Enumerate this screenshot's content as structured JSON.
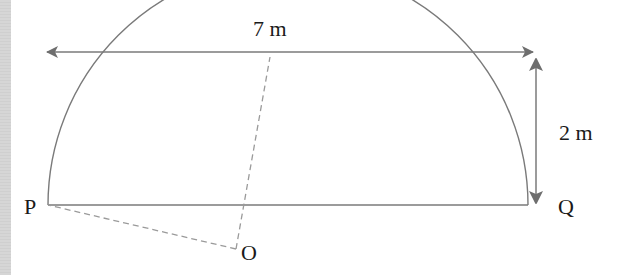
{
  "diagram": {
    "colors": {
      "line": "#7a7a7a",
      "arrow": "#6e6e6e",
      "dashed": "#9a9a9a",
      "text": "#1a1a1a",
      "side_strip": "#d4d4d4"
    },
    "labels": {
      "width": "7 m",
      "height": "2 m",
      "point_p": "P",
      "point_q": "Q",
      "point_o": "O"
    },
    "dimensions": {
      "span_m": 7,
      "rise_m": 2
    },
    "points": {
      "P": [
        48,
        205
      ],
      "Q": [
        528,
        205
      ],
      "O": [
        236,
        249
      ],
      "arc_top": [
        290,
        56
      ]
    }
  }
}
